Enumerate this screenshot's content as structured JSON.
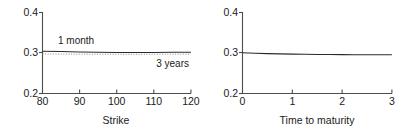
{
  "figure": {
    "panels": [
      {
        "id": "strike-panel",
        "xlabel": "Strike",
        "ylabel": "",
        "xticks": [
          "80",
          "90",
          "100",
          "110",
          "120"
        ],
        "yticks": [
          "0.2",
          "0.3",
          "0.4"
        ],
        "labels": [
          {
            "name": "1-month-label",
            "text": "1 month"
          },
          {
            "name": "3-years-label",
            "text": "3 years"
          }
        ]
      },
      {
        "id": "maturity-panel",
        "xlabel": "Time to maturity",
        "ylabel": "",
        "xticks": [
          "0",
          "1",
          "2",
          "3"
        ],
        "yticks": [
          "0.2",
          "0.3",
          "0.4"
        ],
        "labels": []
      }
    ]
  },
  "chart_data": [
    {
      "type": "line",
      "title": "",
      "xlabel": "Strike",
      "ylabel": "",
      "xlim": [
        80,
        120
      ],
      "ylim": [
        0.2,
        0.4
      ],
      "xticks": [
        80,
        90,
        100,
        110,
        120
      ],
      "yticks": [
        0.2,
        0.3,
        0.4
      ],
      "grid": false,
      "legend": "inline-annotations",
      "annotations": [
        {
          "text": "1 month",
          "x": 84,
          "y": 0.325
        },
        {
          "text": "3 years",
          "x": 114,
          "y": 0.277
        }
      ],
      "series": [
        {
          "name": "1 month",
          "style": "solid",
          "color": "#2b2b2b",
          "x": [
            80,
            85,
            90,
            95,
            100,
            105,
            110,
            115,
            120
          ],
          "values": [
            0.3045,
            0.3035,
            0.3025,
            0.3018,
            0.3013,
            0.3012,
            0.3013,
            0.3016,
            0.302
          ]
        },
        {
          "name": "3 years",
          "style": "dotted",
          "color": "#8c8c8c",
          "x": [
            80,
            85,
            90,
            95,
            100,
            105,
            110,
            115,
            120
          ],
          "values": [
            0.2975,
            0.2973,
            0.2971,
            0.297,
            0.2969,
            0.2969,
            0.297,
            0.2971,
            0.2972
          ]
        }
      ]
    },
    {
      "type": "line",
      "title": "",
      "xlabel": "Time to maturity",
      "ylabel": "",
      "xlim": [
        0,
        3
      ],
      "ylim": [
        0.2,
        0.4
      ],
      "xticks": [
        0,
        1,
        2,
        3
      ],
      "yticks": [
        0.2,
        0.3,
        0.4
      ],
      "grid": false,
      "legend": "none",
      "annotations": [],
      "series": [
        {
          "name": "implied volatility",
          "style": "solid",
          "color": "#2b2b2b",
          "x": [
            0,
            0.25,
            0.5,
            0.75,
            1.0,
            1.25,
            1.5,
            1.75,
            2.0,
            2.25,
            2.5,
            2.75,
            3.0
          ],
          "values": [
            0.3005,
            0.2995,
            0.2985,
            0.2978,
            0.2972,
            0.2968,
            0.2964,
            0.2962,
            0.296,
            0.2959,
            0.2958,
            0.2957,
            0.2957
          ]
        }
      ]
    }
  ]
}
